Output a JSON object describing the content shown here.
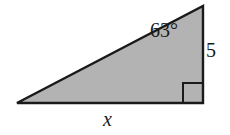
{
  "figure": {
    "type": "right-triangle-diagram",
    "fill_color": "#b3b3b3",
    "stroke_color": "#1a1a1a",
    "background_color": "#ffffff",
    "vertices": {
      "left": [
        17,
        103
      ],
      "top_right": [
        203,
        6
      ],
      "bottom_right": [
        203,
        103
      ]
    },
    "right_angle_marker": {
      "name": "right-angle-square",
      "corner": [
        203,
        103
      ],
      "size": 20
    }
  },
  "labels": {
    "angle": "63°",
    "angle_value": 63,
    "angle_unit": "degrees",
    "vertical_side": "5",
    "vertical_side_value": 5,
    "base": "x",
    "base_value": "x"
  },
  "chart_data": {
    "type": "diagram",
    "title": "",
    "shape": "right triangle",
    "annotations": [
      {
        "label": "63°",
        "position": "interior near top-right vertex",
        "meaning": "acute angle at top vertex"
      },
      {
        "label": "5",
        "position": "right side, outside",
        "meaning": "length of vertical leg"
      },
      {
        "label": "x",
        "position": "below base, outside",
        "meaning": "unknown length of horizontal leg"
      }
    ]
  }
}
